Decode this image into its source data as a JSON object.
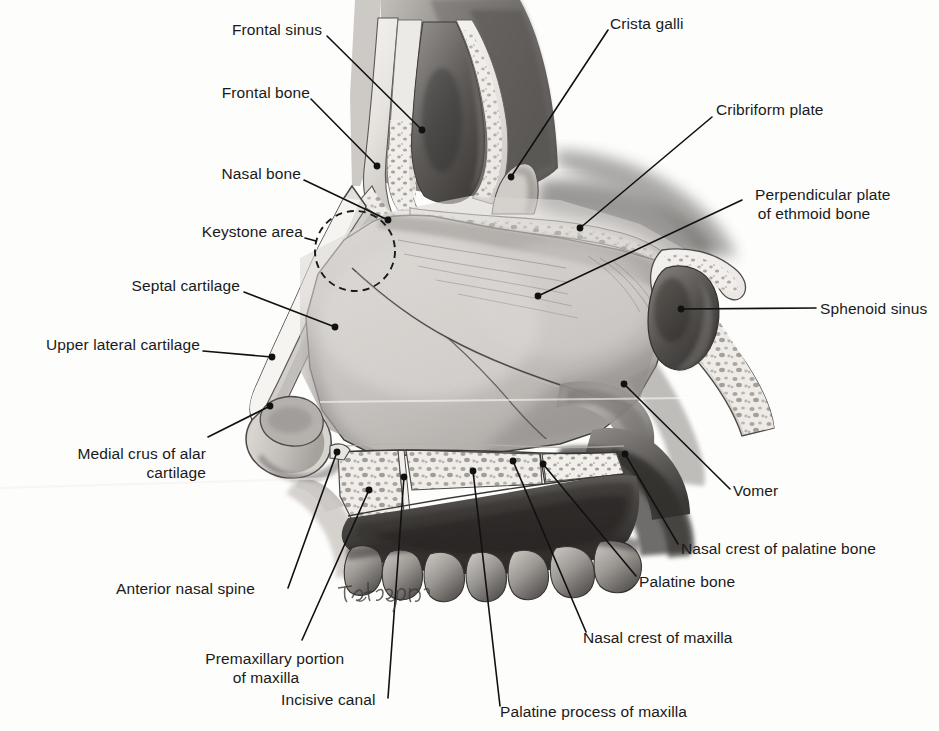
{
  "figure": {
    "background_color": "#fdfdfc",
    "ink_color": "#1a1a1a",
    "width": 939,
    "height": 731,
    "signature": "Echtsinger"
  },
  "labels": [
    {
      "id": "frontal-sinus",
      "text": "Frontal sinus",
      "align": "right",
      "x": 320,
      "y": 28,
      "dot_x": 422,
      "dot_y": 130,
      "lines": [
        "Frontal sinus"
      ]
    },
    {
      "id": "frontal-bone",
      "text": "Frontal bone",
      "align": "right",
      "x": 308,
      "y": 91,
      "dot_x": 377,
      "dot_y": 166,
      "lines": [
        "Frontal bone"
      ]
    },
    {
      "id": "nasal-bone",
      "text": "Nasal bone",
      "align": "right",
      "x": 299,
      "y": 170,
      "dot_x": 388,
      "dot_y": 220,
      "lines": [
        "Nasal bone"
      ]
    },
    {
      "id": "keystone-area",
      "text": "Keystone area",
      "align": "right",
      "x": 307,
      "y": 228,
      "dot_x": 318,
      "dot_y": 240,
      "lines": [
        "Keystone area"
      ]
    },
    {
      "id": "septal-cartilage",
      "text": "Septal cartilage",
      "align": "right",
      "x": 237,
      "y": 283,
      "dot_x": 335,
      "dot_y": 327,
      "lines": [
        "Septal cartilage"
      ]
    },
    {
      "id": "upper-lateral-cartilage",
      "text": "Upper lateral cartilage",
      "align": "right",
      "x": 198,
      "y": 342,
      "dot_x": 272,
      "dot_y": 357,
      "lines": [
        "Upper lateral cartilage"
      ]
    },
    {
      "id": "medial-crus-alar-cartilage",
      "text": "Medial crus of alar cartilage",
      "align": "right",
      "x": 206,
      "y": 432,
      "dot_x": 270,
      "dot_y": 406,
      "lines": [
        "Medial crus of alar",
        "cartilage"
      ]
    },
    {
      "id": "anterior-nasal-spine",
      "text": "Anterior nasal spine",
      "align": "left",
      "x": 116,
      "y": 586,
      "dot_x": 337,
      "dot_y": 452,
      "lines": [
        "Anterior nasal spine"
      ]
    },
    {
      "id": "premaxillary-portion",
      "text": "Premaxillary portion of maxilla",
      "align": "center",
      "x": 168,
      "y": 637,
      "dot_x": 369,
      "dot_y": 490,
      "lines": [
        "Premaxillary portion",
        "of maxilla"
      ]
    },
    {
      "id": "incisive-canal",
      "text": "Incisive canal",
      "align": "left",
      "x": 281,
      "y": 697,
      "dot_x": 404,
      "dot_y": 477,
      "lines": [
        "Incisive canal"
      ]
    },
    {
      "id": "palatine-process-maxilla",
      "text": "Palatine process of maxilla",
      "align": "left",
      "x": 497,
      "y": 709,
      "dot_x": 473,
      "dot_y": 471,
      "lines": [
        "Palatine process of maxilla"
      ]
    },
    {
      "id": "nasal-crest-of-maxilla",
      "text": "Nasal crest of maxilla",
      "align": "left",
      "x": 583,
      "y": 636,
      "dot_x": 513,
      "dot_y": 461,
      "lines": [
        "Nasal crest of maxilla"
      ]
    },
    {
      "id": "palatine-bone",
      "text": "Palatine bone",
      "align": "left",
      "x": 639,
      "y": 580,
      "dot_x": 543,
      "dot_y": 464,
      "lines": [
        "Palatine bone"
      ]
    },
    {
      "id": "nasal-crest-palatine-bone",
      "text": "Nasal crest of palatine bone",
      "align": "left",
      "x": 681,
      "y": 547,
      "dot_x": 625,
      "dot_y": 454,
      "lines": [
        "Nasal crest of palatine bone"
      ]
    },
    {
      "id": "vomer",
      "text": "Vomer",
      "align": "left",
      "x": 733,
      "y": 491,
      "dot_x": 624,
      "dot_y": 384,
      "lines": [
        "Vomer"
      ]
    },
    {
      "id": "sphenoid-sinus",
      "text": "Sphenoid sinus",
      "align": "left",
      "x": 820,
      "y": 300,
      "dot_x": 681,
      "dot_y": 309,
      "lines": [
        "Sphenoid sinus"
      ]
    },
    {
      "id": "perpendicular-plate-ethmoid",
      "text": "Perpendicular plate of ethmoid bone",
      "align": "center",
      "x": 814,
      "y": 173,
      "dot_x": 538,
      "dot_y": 296,
      "lines": [
        "Perpendicular plate",
        "of ethmoid bone"
      ]
    },
    {
      "id": "cribriform-plate",
      "text": "Cribriform plate",
      "align": "left",
      "x": 716,
      "y": 107,
      "dot_x": 580,
      "dot_y": 228,
      "lines": [
        "Cribriform plate"
      ]
    },
    {
      "id": "crista-galli",
      "text": "Crista galli",
      "align": "left",
      "x": 610,
      "y": 21,
      "dot_x": 511,
      "dot_y": 177,
      "lines": [
        "Crista galli"
      ]
    }
  ],
  "annotations": {
    "keystone_circle": {
      "cx": 355,
      "cy": 251,
      "r": 40,
      "style": "dashed"
    }
  }
}
